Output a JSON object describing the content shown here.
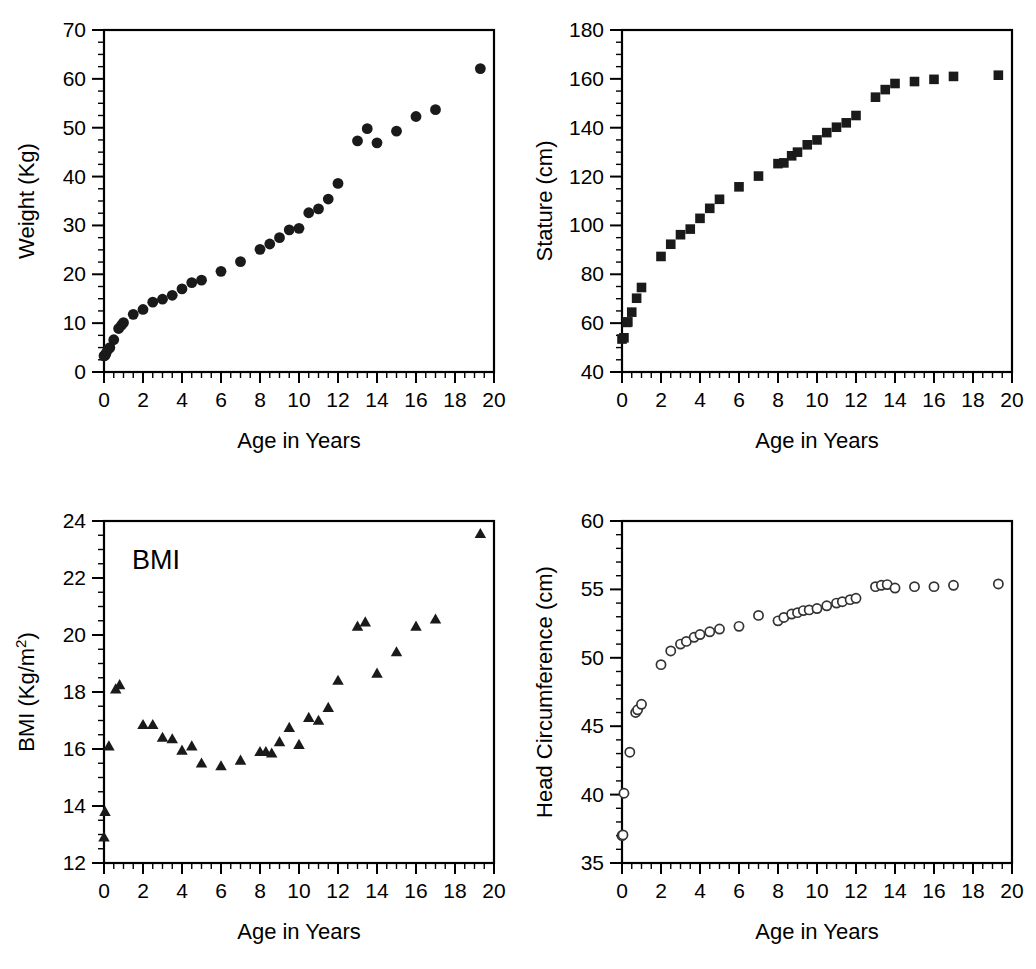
{
  "figure": {
    "panels": [
      "weight",
      "stature",
      "bmi",
      "head_circumference"
    ]
  },
  "chart_data": [
    {
      "id": "weight",
      "type": "scatter",
      "title": "",
      "xlabel": "Age in Years",
      "ylabel": "Weight (Kg)",
      "xlim": [
        0,
        20
      ],
      "ylim": [
        0,
        70
      ],
      "xticks": [
        0,
        2,
        4,
        6,
        8,
        10,
        12,
        14,
        16,
        18,
        20
      ],
      "yticks": [
        0,
        10,
        20,
        30,
        40,
        50,
        60,
        70
      ],
      "xtick_labels": [
        "0",
        "2",
        "4",
        "6",
        "8",
        "10",
        "12",
        "14",
        "16",
        "18",
        "20"
      ],
      "ytick_labels": [
        "0",
        "10",
        "20",
        "30",
        "40",
        "50",
        "60",
        "70"
      ],
      "minor_tick_step_x": 0.5,
      "minor_tick_step_y": 2.5,
      "grid": false,
      "legend": null,
      "marker": "filled-circle",
      "marker_color": "#1a1a1a",
      "points": [
        [
          0.0,
          3.3
        ],
        [
          0.05,
          3.4
        ],
        [
          0.1,
          3.8
        ],
        [
          0.2,
          4.6
        ],
        [
          0.3,
          5.0
        ],
        [
          0.5,
          6.6
        ],
        [
          0.75,
          8.9
        ],
        [
          0.9,
          9.6
        ],
        [
          1.0,
          10.1
        ],
        [
          1.5,
          11.8
        ],
        [
          2.0,
          12.8
        ],
        [
          2.5,
          14.3
        ],
        [
          3.0,
          14.9
        ],
        [
          3.5,
          15.7
        ],
        [
          4.0,
          17.0
        ],
        [
          4.5,
          18.3
        ],
        [
          5.0,
          18.8
        ],
        [
          6.0,
          20.6
        ],
        [
          7.0,
          22.6
        ],
        [
          8.0,
          25.1
        ],
        [
          8.5,
          26.2
        ],
        [
          9.0,
          27.5
        ],
        [
          9.5,
          29.1
        ],
        [
          10.0,
          29.4
        ],
        [
          10.5,
          32.6
        ],
        [
          11.0,
          33.4
        ],
        [
          11.5,
          35.4
        ],
        [
          12.0,
          38.6
        ],
        [
          13.0,
          47.3
        ],
        [
          13.5,
          49.8
        ],
        [
          14.0,
          46.9
        ],
        [
          15.0,
          49.3
        ],
        [
          16.0,
          52.3
        ],
        [
          17.0,
          53.7
        ],
        [
          19.3,
          62.1
        ]
      ]
    },
    {
      "id": "stature",
      "type": "scatter",
      "title": "",
      "xlabel": "Age in Years",
      "ylabel": "Stature (cm)",
      "xlim": [
        0,
        20
      ],
      "ylim": [
        40,
        180
      ],
      "xticks": [
        0,
        2,
        4,
        6,
        8,
        10,
        12,
        14,
        16,
        18,
        20
      ],
      "yticks": [
        40,
        60,
        80,
        100,
        120,
        140,
        160,
        180
      ],
      "xtick_labels": [
        "0",
        "2",
        "4",
        "6",
        "8",
        "10",
        "12",
        "14",
        "16",
        "18",
        "20"
      ],
      "ytick_labels": [
        "40",
        "60",
        "80",
        "100",
        "120",
        "140",
        "160",
        "180"
      ],
      "minor_tick_step_x": 0.5,
      "minor_tick_step_y": 5,
      "grid": false,
      "legend": null,
      "marker": "filled-square",
      "marker_color": "#1a1a1a",
      "points": [
        [
          0.0,
          53.5
        ],
        [
          0.1,
          54.0
        ],
        [
          0.25,
          60.3
        ],
        [
          0.3,
          60.5
        ],
        [
          0.5,
          64.5
        ],
        [
          0.75,
          70.2
        ],
        [
          1.0,
          74.6
        ],
        [
          2.0,
          87.3
        ],
        [
          2.5,
          92.3
        ],
        [
          3.0,
          96.2
        ],
        [
          3.5,
          98.5
        ],
        [
          4.0,
          102.9
        ],
        [
          4.5,
          107.0
        ],
        [
          5.0,
          110.7
        ],
        [
          6.0,
          115.8
        ],
        [
          7.0,
          120.2
        ],
        [
          8.0,
          125.3
        ],
        [
          8.3,
          125.6
        ],
        [
          8.7,
          128.5
        ],
        [
          9.0,
          130.0
        ],
        [
          9.5,
          133.0
        ],
        [
          10.0,
          135.0
        ],
        [
          10.5,
          138.0
        ],
        [
          11.0,
          140.2
        ],
        [
          11.5,
          142.0
        ],
        [
          12.0,
          145.0
        ],
        [
          13.0,
          152.5
        ],
        [
          13.5,
          155.6
        ],
        [
          14.0,
          158.1
        ],
        [
          15.0,
          158.9
        ],
        [
          16.0,
          159.8
        ],
        [
          17.0,
          161.0
        ],
        [
          19.3,
          161.5
        ]
      ]
    },
    {
      "id": "bmi",
      "type": "scatter",
      "title": "BMI",
      "annotation": "BMI",
      "xlabel": "Age in Years",
      "ylabel": "BMI (Kg/m2)",
      "ylabel_base": "BMI (Kg/m",
      "ylabel_sup": "2",
      "ylabel_tail": ")",
      "xlim": [
        0,
        20
      ],
      "ylim": [
        12,
        24
      ],
      "xticks": [
        0,
        2,
        4,
        6,
        8,
        10,
        12,
        14,
        16,
        18,
        20
      ],
      "yticks": [
        12,
        14,
        16,
        18,
        20,
        22,
        24
      ],
      "xtick_labels": [
        "0",
        "2",
        "4",
        "6",
        "8",
        "10",
        "12",
        "14",
        "16",
        "18",
        "20"
      ],
      "ytick_labels": [
        "12",
        "14",
        "16",
        "18",
        "20",
        "22",
        "24"
      ],
      "minor_tick_step_x": 0.5,
      "minor_tick_step_y": 0.5,
      "grid": false,
      "legend": null,
      "marker": "filled-triangle",
      "marker_color": "#1a1a1a",
      "points": [
        [
          0.0,
          12.9
        ],
        [
          0.05,
          13.8
        ],
        [
          0.25,
          16.1
        ],
        [
          0.6,
          18.1
        ],
        [
          0.8,
          18.25
        ],
        [
          2.0,
          16.85
        ],
        [
          2.5,
          16.85
        ],
        [
          3.0,
          16.4
        ],
        [
          3.5,
          16.35
        ],
        [
          4.0,
          15.95
        ],
        [
          4.5,
          16.1
        ],
        [
          5.0,
          15.5
        ],
        [
          6.0,
          15.4
        ],
        [
          7.0,
          15.6
        ],
        [
          8.0,
          15.9
        ],
        [
          8.3,
          15.9
        ],
        [
          8.6,
          15.85
        ],
        [
          9.0,
          16.25
        ],
        [
          9.5,
          16.75
        ],
        [
          10.0,
          16.15
        ],
        [
          10.5,
          17.1
        ],
        [
          11.0,
          17.0
        ],
        [
          11.5,
          17.45
        ],
        [
          12.0,
          18.4
        ],
        [
          13.0,
          20.3
        ],
        [
          13.4,
          20.45
        ],
        [
          14.0,
          18.65
        ],
        [
          15.0,
          19.4
        ],
        [
          16.0,
          20.3
        ],
        [
          17.0,
          20.55
        ],
        [
          19.3,
          23.55
        ]
      ]
    },
    {
      "id": "head_circumference",
      "type": "scatter",
      "title": "",
      "xlabel": "Age in Years",
      "ylabel": "Head Circumference (cm)",
      "xlim": [
        0,
        20
      ],
      "ylim": [
        35,
        60
      ],
      "xticks": [
        0,
        2,
        4,
        6,
        8,
        10,
        12,
        14,
        16,
        18,
        20
      ],
      "yticks": [
        35,
        40,
        45,
        50,
        55,
        60
      ],
      "xtick_labels": [
        "35",
        "40",
        "45",
        "50",
        "55",
        "60"
      ],
      "xtick_labels_x": [
        "0",
        "2",
        "4",
        "6",
        "8",
        "10",
        "12",
        "14",
        "16",
        "18",
        "20"
      ],
      "ytick_labels": [
        "35",
        "40",
        "45",
        "50",
        "55",
        "60"
      ],
      "minor_tick_step_x": 0.5,
      "minor_tick_step_y": 1,
      "grid": false,
      "legend": null,
      "marker": "open-circle",
      "marker_color": "#333333",
      "points": [
        [
          0.0,
          37.0
        ],
        [
          0.05,
          37.05
        ],
        [
          0.1,
          40.1
        ],
        [
          0.4,
          43.1
        ],
        [
          0.7,
          46.0
        ],
        [
          0.8,
          46.2
        ],
        [
          1.0,
          46.6
        ],
        [
          2.0,
          49.5
        ],
        [
          2.5,
          50.5
        ],
        [
          3.0,
          51.0
        ],
        [
          3.3,
          51.2
        ],
        [
          3.7,
          51.5
        ],
        [
          4.0,
          51.7
        ],
        [
          4.5,
          51.9
        ],
        [
          5.0,
          52.1
        ],
        [
          6.0,
          52.3
        ],
        [
          7.0,
          53.1
        ],
        [
          8.0,
          52.7
        ],
        [
          8.3,
          52.95
        ],
        [
          8.7,
          53.2
        ],
        [
          9.0,
          53.3
        ],
        [
          9.3,
          53.45
        ],
        [
          9.6,
          53.5
        ],
        [
          10.0,
          53.6
        ],
        [
          10.5,
          53.8
        ],
        [
          11.0,
          54.0
        ],
        [
          11.3,
          54.1
        ],
        [
          11.7,
          54.25
        ],
        [
          12.0,
          54.35
        ],
        [
          13.0,
          55.2
        ],
        [
          13.3,
          55.3
        ],
        [
          13.6,
          55.35
        ],
        [
          14.0,
          55.1
        ],
        [
          15.0,
          55.2
        ],
        [
          16.0,
          55.2
        ],
        [
          17.0,
          55.3
        ],
        [
          19.3,
          55.4
        ]
      ]
    }
  ]
}
